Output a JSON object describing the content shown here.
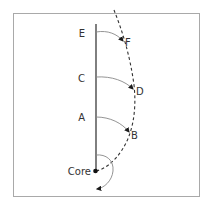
{
  "diagram": {
    "labels": {
      "core": "Core",
      "E": "E",
      "F": "F",
      "C": "C",
      "D": "D",
      "A": "A",
      "B": "B"
    },
    "colors": {
      "line": "#2b2b2b",
      "arc": "#888888",
      "frame": "#a9a9a9",
      "text": "#333333"
    }
  }
}
